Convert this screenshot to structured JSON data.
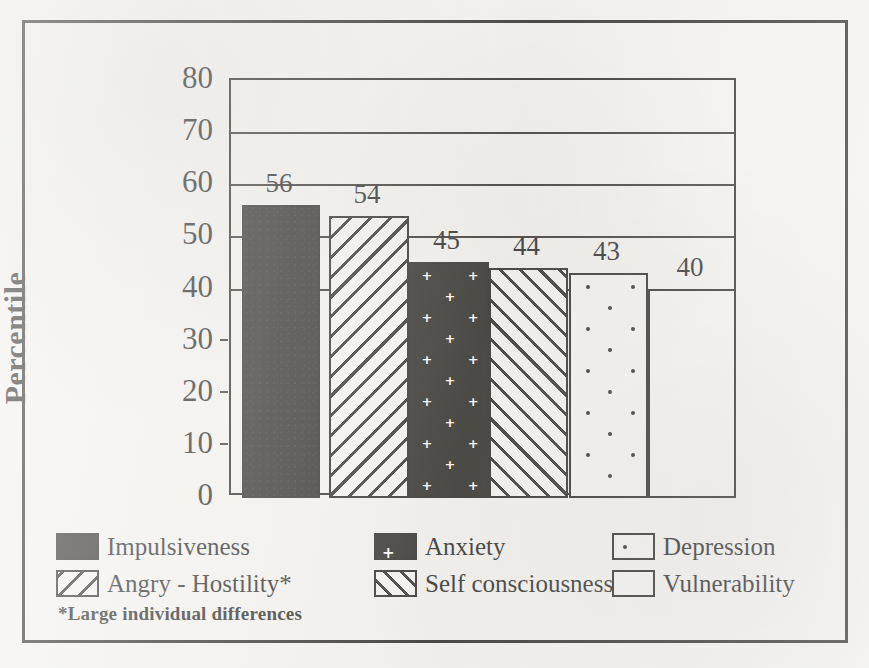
{
  "chart_data": {
    "type": "bar",
    "title": "",
    "xlabel": "",
    "ylabel": "Percentile",
    "ylim": [
      0,
      80
    ],
    "ytick_step": 10,
    "ytick_labels": [
      "80",
      "70",
      "60",
      "50",
      "40",
      "30",
      "20",
      "10",
      "0"
    ],
    "grid": "horizontal gridlines at 40, 50, 60, 70, 80",
    "legend_position": "below plot, three columns of two rows",
    "categories": [
      "Impulsiveness",
      "Angry - Hostility*",
      "Anxiety",
      "Self consciousness",
      "Depression",
      "Vulnerability"
    ],
    "values": [
      56,
      54,
      45,
      44,
      43,
      40
    ],
    "value_labels": [
      "56",
      "54",
      "45",
      "44",
      "43",
      "40"
    ],
    "patterns": [
      "solid-black",
      "diagonal-hatch-backslash",
      "black-with-white-plus",
      "diagonal-hatch-forwardslash",
      "white-with-dots",
      "plain-white"
    ],
    "annotations": [
      "*Large individual differences"
    ]
  },
  "axis": {
    "y_title": "Percentile",
    "ticks": [
      {
        "label": "80",
        "value": 80
      },
      {
        "label": "70",
        "value": 70
      },
      {
        "label": "60",
        "value": 60
      },
      {
        "label": "50",
        "value": 50
      },
      {
        "label": "40",
        "value": 40
      },
      {
        "label": "30",
        "value": 30
      },
      {
        "label": "20",
        "value": 20
      },
      {
        "label": "10",
        "value": 10
      },
      {
        "label": "0",
        "value": 0
      }
    ]
  },
  "bars": [
    {
      "name": "Impulsiveness",
      "value": 56,
      "label": "56"
    },
    {
      "name": "Angry - Hostility*",
      "value": 54,
      "label": "54"
    },
    {
      "name": "Anxiety",
      "value": 45,
      "label": "45"
    },
    {
      "name": "Self consciousness",
      "value": 44,
      "label": "44"
    },
    {
      "name": "Depression",
      "value": 43,
      "label": "43"
    },
    {
      "name": "Vulnerability",
      "value": 40,
      "label": "40"
    }
  ],
  "legend": {
    "items": [
      {
        "label": "Impulsiveness",
        "pattern": "solid-black"
      },
      {
        "label": "Anxiety",
        "pattern": "black-with-white-plus"
      },
      {
        "label": "Depression",
        "pattern": "white-with-dots"
      },
      {
        "label": "Angry - Hostility*",
        "pattern": "diagonal-hatch-backslash"
      },
      {
        "label": "Self consciousness",
        "pattern": "diagonal-hatch-forwardslash"
      },
      {
        "label": "Vulnerability",
        "pattern": "plain-white"
      }
    ]
  },
  "footnote": "*Large individual differences",
  "colors": {
    "ink": "#17150f",
    "paper": "#f2f1ee",
    "bar_fill": "#f4f3f0"
  }
}
